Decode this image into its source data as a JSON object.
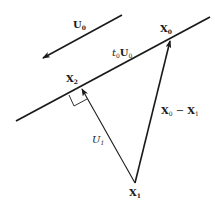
{
  "diagram": {
    "type": "vector-geometry",
    "colors": {
      "stroke": "#1a1a1a",
      "background": "#ffffff"
    },
    "labels": {
      "u0": {
        "base": "U",
        "sub": "0"
      },
      "t0u0": {
        "prefix": "t",
        "prefix_sub": "0",
        "base": "U",
        "sub": "0"
      },
      "x0": {
        "base": "X",
        "sub": "0"
      },
      "x2": {
        "base": "X",
        "sub": "2"
      },
      "x1": {
        "base": "X",
        "sub": "1"
      },
      "u1": {
        "base": "U",
        "sub": "1"
      },
      "x0_minus_x1": {
        "a": "X",
        "a_sub": "0",
        "op": " − ",
        "b": "X",
        "b_sub": "1"
      }
    },
    "elements": [
      {
        "id": "direction-arrow-u0",
        "from": [
          122,
          15
        ],
        "to": [
          43,
          58
        ],
        "arrowhead": "end"
      },
      {
        "id": "line",
        "from": [
          16,
          121
        ],
        "to": [
          210,
          17
        ]
      },
      {
        "id": "vector-x1-x0",
        "from": [
          135,
          183
        ],
        "to": [
          170,
          40
        ],
        "arrowhead": "end"
      },
      {
        "id": "vector-x1-x2",
        "from": [
          135,
          183
        ],
        "to": [
          82,
          88
        ],
        "arrowhead": "end"
      },
      {
        "id": "right-angle-marker",
        "at": [
          82,
          88
        ]
      }
    ]
  }
}
